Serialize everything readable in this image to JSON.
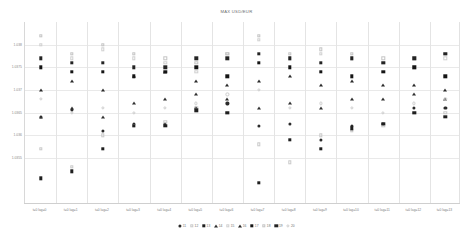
{
  "chart_data": {
    "type": "scatter",
    "title": "MAX USD/EUR",
    "xlabel": "",
    "ylabel": "",
    "grid": true,
    "legend_position": "bottom",
    "ylim": [
      1.0345,
      1.0385
    ],
    "yticks": [
      "1.038",
      "1.0375",
      "1.037",
      "1.0365",
      "1.036",
      "1.0355"
    ],
    "ytick_values": [
      1.038,
      1.0375,
      1.037,
      1.0365,
      1.036,
      1.0355
    ],
    "categories": [
      "t=0 lag=0",
      "t=0 lag=1",
      "t=0 lag=2",
      "t=0 lag=3",
      "t=0 lag=4",
      "t=0 lag=5",
      "t=0 lag=6",
      "t=0 lag=7",
      "t=0 lag=8",
      "t=0 lag=9",
      "t=0 lag=10",
      "t=0 lag=11",
      "t=0 lag=12",
      "t=0 lag=13"
    ],
    "series": [
      {
        "name": "11",
        "marker": "circle",
        "fill": "solid",
        "color": "#2b2b2b",
        "values": [
          1.0364,
          1.03655,
          1.0361,
          1.03625,
          1.03625,
          1.0366,
          1.0367,
          1.0362,
          1.03625,
          1.0359,
          1.0362,
          1.03625,
          1.0366,
          1.0366
        ]
      },
      {
        "name": "12",
        "marker": "square",
        "fill": "open",
        "color": "#c9c9c9",
        "values": [
          1.0357,
          1.0353,
          1.036,
          1.0362,
          1.0363,
          1.0366,
          1.0365,
          1.0358,
          1.0354,
          1.036,
          1.0361,
          1.0362,
          1.0365,
          1.0365
        ]
      },
      {
        "name": "13",
        "marker": "square",
        "fill": "solid",
        "color": "#1f1f1f",
        "values": [
          1.03505,
          1.0352,
          1.0357,
          1.0362,
          1.0362,
          1.03655,
          1.0365,
          1.03495,
          1.0359,
          1.0357,
          1.03615,
          1.03625,
          1.0365,
          1.0364
        ]
      },
      {
        "name": "14",
        "marker": "triangle",
        "fill": "solid",
        "color": "#303030",
        "values": [
          1.0364,
          1.0366,
          1.0364,
          1.0367,
          1.0368,
          1.0369,
          1.0368,
          1.0366,
          1.0367,
          1.0366,
          1.0368,
          1.0368,
          1.0369,
          1.0368
        ]
      },
      {
        "name": "15",
        "marker": "square",
        "fill": "open",
        "color": "#d0d0d0",
        "values": [
          1.038,
          1.0377,
          1.0379,
          1.0377,
          1.0376,
          1.0374,
          1.0378,
          1.0381,
          1.0377,
          1.0378,
          1.0377,
          1.0376,
          1.0375,
          1.0377
        ]
      },
      {
        "name": "16",
        "marker": "triangle",
        "fill": "solid",
        "color": "#2a2a2a",
        "values": [
          1.037,
          1.0372,
          1.037,
          1.0373,
          1.0374,
          1.0372,
          1.0371,
          1.0372,
          1.0373,
          1.0371,
          1.0372,
          1.0371,
          1.0371,
          1.037
        ]
      },
      {
        "name": "17",
        "marker": "square",
        "fill": "solid",
        "color": "#151515",
        "values": [
          1.0375,
          1.0374,
          1.0374,
          1.0373,
          1.0374,
          1.0375,
          1.0373,
          1.0376,
          1.0375,
          1.0374,
          1.0373,
          1.0374,
          1.0375,
          1.0373
        ]
      },
      {
        "name": "18",
        "marker": "square",
        "fill": "open",
        "color": "#c4c4c4",
        "values": [
          1.0382,
          1.0378,
          1.038,
          1.0378,
          1.0377,
          1.0376,
          1.0378,
          1.0382,
          1.0378,
          1.0379,
          1.0378,
          1.0377,
          1.0377,
          1.0378
        ]
      },
      {
        "name": "19",
        "marker": "square",
        "fill": "solid",
        "color": "#242424",
        "values": [
          1.0377,
          1.0376,
          1.0376,
          1.0375,
          1.0375,
          1.0377,
          1.0377,
          1.0378,
          1.0377,
          1.0376,
          1.0377,
          1.0376,
          1.0377,
          1.0378
        ]
      },
      {
        "name": "20",
        "marker": "circle",
        "fill": "open",
        "color": "#cecece",
        "values": [
          1.0368,
          1.0365,
          1.0366,
          1.0365,
          1.0366,
          1.0367,
          1.0369,
          1.037,
          1.0366,
          1.0367,
          1.0366,
          1.0365,
          1.0367,
          1.0368
        ]
      }
    ]
  }
}
